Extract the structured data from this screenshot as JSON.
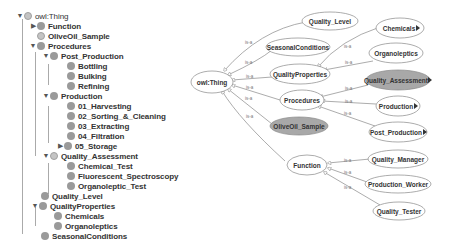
{
  "tree": {
    "root": "owl:Thing",
    "items": [
      {
        "label": "owl:Thing",
        "level": 0,
        "toggle": "expanded"
      },
      {
        "label": "Function",
        "level": 1,
        "toggle": "collapsed"
      },
      {
        "label": "OliveOil_Sample",
        "level": 1,
        "toggle": "none"
      },
      {
        "label": "Procedures",
        "level": 1,
        "toggle": "expanded"
      },
      {
        "label": "Post_Production",
        "level": 2,
        "toggle": "expanded"
      },
      {
        "label": "Bottling",
        "level": 3,
        "toggle": "none"
      },
      {
        "label": "Bulking",
        "level": 3,
        "toggle": "none"
      },
      {
        "label": "Refining",
        "level": 3,
        "toggle": "none"
      },
      {
        "label": "Production",
        "level": 2,
        "toggle": "expanded"
      },
      {
        "label": "01_Harvesting",
        "level": 3,
        "toggle": "none"
      },
      {
        "label": "02_Sorting_&_Cleaning",
        "level": 3,
        "toggle": "none"
      },
      {
        "label": "03_Extracting",
        "level": 3,
        "toggle": "none"
      },
      {
        "label": "04_Filtration",
        "level": 3,
        "toggle": "none"
      },
      {
        "label": "05_Storage",
        "level": 3,
        "toggle": "collapsed"
      },
      {
        "label": "Quality_Assessment",
        "level": 2,
        "toggle": "expanded"
      },
      {
        "label": "Chemical_Test",
        "level": 3,
        "toggle": "none"
      },
      {
        "label": "Fluorescent_Spectroscopy",
        "level": 3,
        "toggle": "none"
      },
      {
        "label": "Organoleptic_Test",
        "level": 3,
        "toggle": "none"
      },
      {
        "label": "Quality_Level",
        "level": 1,
        "toggle": "none"
      },
      {
        "label": "QualityProperties",
        "level": 1,
        "toggle": "expanded"
      },
      {
        "label": "Chemicals",
        "level": 2,
        "toggle": "none"
      },
      {
        "label": "Organoleptics",
        "level": 2,
        "toggle": "none"
      },
      {
        "label": "SeasonalConditions",
        "level": 1,
        "toggle": "none"
      }
    ]
  },
  "graph": {
    "edge_label": "is-a",
    "nodes": {
      "thing": "owl:Thing",
      "quality_level": "Quality_Level",
      "seasonal": "SeasonalConditions",
      "quality_props": "QualityProperties",
      "procedures": "Procedures",
      "olive_sample": "OliveOil_Sample",
      "function": "Function",
      "chemicals": "Chemicals",
      "organoleptics": "Organoleptics",
      "quality_assessment": "Quality_Assessment",
      "production": "Production",
      "post_production": "Post_Production",
      "quality_manager": "Quality_Manager",
      "production_worker": "Production_Worker",
      "quality_tester": "Quality_Tester"
    },
    "colors": {
      "node_fill": "#ffffff",
      "node_fill_highlight": "#a8a8a8",
      "edge": "#888888"
    }
  }
}
